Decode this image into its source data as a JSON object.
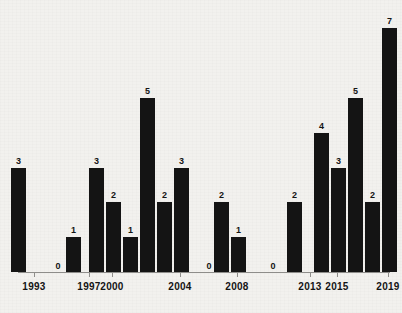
{
  "chart_data": {
    "type": "bar",
    "title": "",
    "subtitle": "",
    "xlabel": "",
    "ylabel": "",
    "grid": false,
    "legend": null,
    "ylim": [
      0,
      7
    ],
    "xlim": [
      "1993",
      "2020"
    ],
    "bar_color": "#141414",
    "background_color": "#f2f1ee",
    "axis_color": "#8e8d8a",
    "categories": [
      "1993",
      "1994",
      "1995",
      "1996",
      "1997",
      "1998",
      "1999",
      "2000",
      "2001",
      "2002",
      "2003",
      "2004",
      "2005",
      "2006",
      "2007",
      "2008",
      "2009",
      "2010",
      "2011",
      "2012",
      "2013",
      "2014",
      "2015",
      "2016",
      "2017",
      "2018",
      "2019",
      "2020"
    ],
    "values": [
      3,
      0,
      0,
      0,
      1,
      0,
      0,
      3,
      2,
      1,
      5,
      2,
      3,
      0,
      0,
      2,
      1,
      0,
      0,
      0,
      2,
      0,
      4,
      3,
      5,
      2,
      7,
      0
    ],
    "data_labels": [
      "3",
      "0",
      "",
      "",
      "1",
      "",
      "",
      "3",
      "2",
      "1",
      "5",
      "2",
      "3",
      "0",
      "",
      "2",
      "1",
      "",
      "",
      "",
      "2",
      "0",
      "4",
      "3",
      "5",
      "2",
      "7",
      ""
    ],
    "tick_labels": [
      "1993",
      "1997",
      "2000",
      "2004",
      "2008",
      "2013",
      "2015",
      "2019"
    ],
    "tick_categories": [
      "1993",
      "1997",
      "2000",
      "2004",
      "2008",
      "2013",
      "2015",
      "2019"
    ],
    "visible_zero_labels": [
      "1994",
      "2005",
      "2010",
      "2014"
    ],
    "points": [
      {
        "category": "1993",
        "value": 3,
        "label": "3"
      },
      {
        "category": "1994",
        "value": 0,
        "label": "0"
      },
      {
        "category": "1997",
        "value": 1,
        "label": "1"
      },
      {
        "category": "2000",
        "value": 3,
        "label": "3"
      },
      {
        "category": "2001",
        "value": 2,
        "label": "2"
      },
      {
        "category": "2002",
        "value": 1,
        "label": "1"
      },
      {
        "category": "2003",
        "value": 5,
        "label": "5"
      },
      {
        "category": "2004",
        "value": 2,
        "label": "2"
      },
      {
        "category": "2005",
        "value": 3,
        "label": "3"
      },
      {
        "category": "2006",
        "value": 0,
        "label": "0"
      },
      {
        "category": "2008",
        "value": 2,
        "label": "2"
      },
      {
        "category": "2009",
        "value": 1,
        "label": "1"
      },
      {
        "category": "2011",
        "value": 0,
        "label": "0"
      },
      {
        "category": "2013",
        "value": 2,
        "label": "2"
      },
      {
        "category": "2014",
        "value": 0,
        "label": "0"
      },
      {
        "category": "2015",
        "value": 4,
        "label": "4"
      },
      {
        "category": "2016",
        "value": 3,
        "label": "3"
      },
      {
        "category": "2017",
        "value": 5,
        "label": "5"
      },
      {
        "category": "2018",
        "value": 2,
        "label": "2"
      },
      {
        "category": "2019",
        "value": 7,
        "label": "7"
      }
    ]
  },
  "bars": [
    {
      "name": "bar-1993",
      "label": "3",
      "value": 3,
      "x": 26,
      "width": 15
    },
    {
      "name": "bar-1997",
      "label": "1",
      "value": 1,
      "x": 81,
      "width": 15
    },
    {
      "name": "bar-2000",
      "label": "3",
      "value": 3,
      "x": 104,
      "width": 15
    },
    {
      "name": "bar-2001",
      "label": "2",
      "value": 2,
      "x": 121,
      "width": 15
    },
    {
      "name": "bar-2002",
      "label": "1",
      "value": 1,
      "x": 138,
      "width": 15
    },
    {
      "name": "bar-2003",
      "label": "5",
      "value": 5,
      "x": 155,
      "width": 15
    },
    {
      "name": "bar-2004",
      "label": "2",
      "value": 2,
      "x": 172,
      "width": 15
    },
    {
      "name": "bar-2005",
      "label": "3",
      "value": 3,
      "x": 189,
      "width": 15
    },
    {
      "name": "bar-2008",
      "label": "2",
      "value": 2,
      "x": 229,
      "width": 15
    },
    {
      "name": "bar-2009",
      "label": "1",
      "value": 1,
      "x": 246,
      "width": 15
    },
    {
      "name": "bar-2013",
      "label": "2",
      "value": 2,
      "x": 302,
      "width": 15
    },
    {
      "name": "bar-2015",
      "label": "4",
      "value": 4,
      "x": 329,
      "width": 15
    },
    {
      "name": "bar-2016",
      "label": "3",
      "value": 3,
      "x": 346,
      "width": 15
    },
    {
      "name": "bar-2017",
      "label": "5",
      "value": 5,
      "x": 363,
      "width": 15
    },
    {
      "name": "bar-2018",
      "label": "2",
      "value": 2,
      "x": 380,
      "width": 15
    },
    {
      "name": "bar-2019",
      "label": "7",
      "value": 7,
      "x": 397,
      "width": 15
    }
  ],
  "zero_labels": [
    {
      "name": "zero-label-1994",
      "label": "0",
      "x": 58
    },
    {
      "name": "zero-label-2006",
      "label": "0",
      "x": 209
    },
    {
      "name": "zero-label-2011",
      "label": "0",
      "x": 273
    },
    {
      "name": "zero-label-2014",
      "label": "0",
      "x": 320
    }
  ],
  "x_ticks": [
    {
      "name": "x-tick-1993",
      "label": "1993",
      "x": 34
    },
    {
      "name": "x-tick-1997",
      "label": "1997",
      "x": 89
    },
    {
      "name": "x-tick-2000",
      "label": "2000",
      "x": 112
    },
    {
      "name": "x-tick-2004",
      "label": "2004",
      "x": 180
    },
    {
      "name": "x-tick-2008",
      "label": "2008",
      "x": 237
    },
    {
      "name": "x-tick-2013",
      "label": "2013",
      "x": 310
    },
    {
      "name": "x-tick-2015",
      "label": "2015",
      "x": 337
    },
    {
      "name": "x-tick-2019",
      "label": "2019",
      "x": 388
    }
  ],
  "geometry": {
    "baseline_y": 272,
    "unit_px": 34.8,
    "axis_left": 18,
    "axis_right": 390,
    "tick_height": 5,
    "tick_label_y": 281,
    "value_label_offset": 12
  }
}
